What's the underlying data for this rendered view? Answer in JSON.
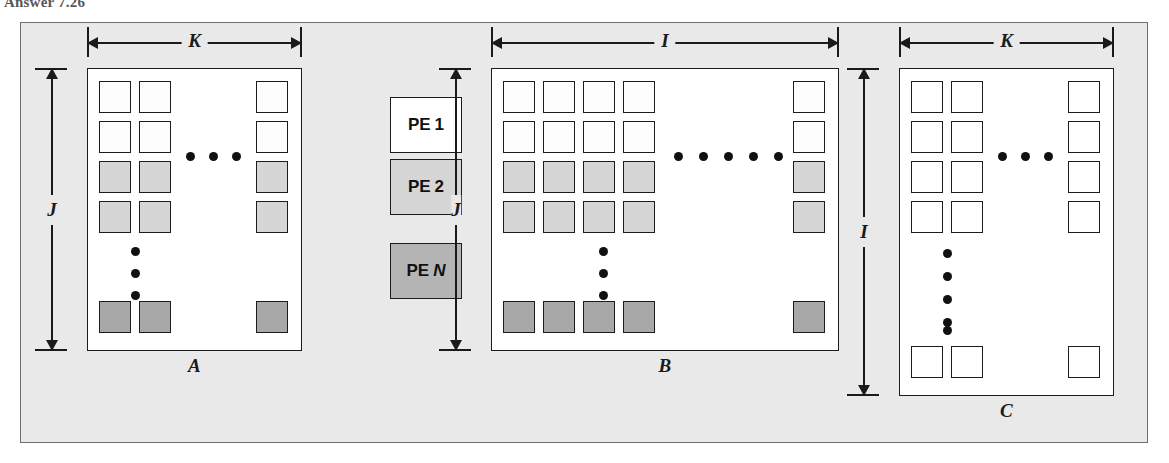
{
  "page": {
    "header_fragment": "Answer 7.26"
  },
  "figure": {
    "legend": {
      "items": [
        {
          "prefix": "PE",
          "num": "1",
          "shade": "#ffffff",
          "name": "pe-1"
        },
        {
          "prefix": "PE",
          "num": "2",
          "shade": "#d6d6d6",
          "name": "pe-2"
        },
        {
          "prefix": "PE",
          "num": "N",
          "shade": "#b4b4b4",
          "name": "pe-n"
        }
      ]
    },
    "matrices": [
      {
        "id": "A",
        "label": "A",
        "label_script": "𝒜",
        "width_dim": "K",
        "height_dim": "J",
        "cols_shown": 2,
        "rows_shown": 4,
        "has_right_col": true,
        "has_bottom_row": true,
        "h_dots": 3,
        "v_dots": 3,
        "row_shades": [
          "pe1",
          "pe1",
          "pe2",
          "pe2"
        ],
        "bottom_shade": "peN"
      },
      {
        "id": "B",
        "label": "B",
        "label_script": "𝐵",
        "width_dim": "I",
        "height_dim": "J",
        "cols_shown": 4,
        "rows_shown": 4,
        "has_right_col": true,
        "has_bottom_row": true,
        "h_dots": 5,
        "v_dots": 3,
        "row_shades": [
          "pe1",
          "pe1",
          "pe2",
          "pe2"
        ],
        "bottom_shade": "peN"
      },
      {
        "id": "C",
        "label": "C",
        "label_script": "𝒞",
        "width_dim": "K",
        "height_dim": "I",
        "cols_shown": 2,
        "rows_shown": 4,
        "has_right_col": true,
        "has_bottom_row": true,
        "h_dots": 3,
        "v_dots": 5,
        "row_shades": [
          "plain",
          "plain",
          "plain",
          "plain"
        ],
        "bottom_shade": "plain"
      }
    ],
    "colors": {
      "frame_bg": "#e9e9e9",
      "frame_border": "#6e6e6e",
      "matrix_bg": "#ffffff",
      "cell_border": "#1c1c1c",
      "shade_pe1": "#fdfdfd",
      "shade_pe2": "#d6d6d6",
      "shade_peN": "#a8a8a8",
      "dot": "#111111"
    }
  }
}
